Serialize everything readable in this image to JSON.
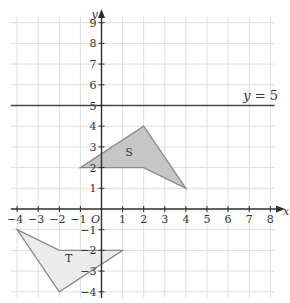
{
  "diagram": {
    "type": "coordinate-grid",
    "axes": {
      "x_label": "y",
      "x_axis_name": "x",
      "y_axis_name": "y",
      "origin_label": "O",
      "x_ticks": [
        -4,
        -3,
        -2,
        -1,
        1,
        2,
        3,
        4,
        5,
        6,
        7,
        8
      ],
      "y_ticks": [
        9,
        8,
        7,
        6,
        5,
        4,
        3,
        2,
        1,
        -1,
        -2,
        -3,
        -4
      ],
      "x_range": [
        -4.3,
        8.2
      ],
      "y_range": [
        -4.3,
        9.3
      ]
    },
    "line": {
      "label": "y = 5",
      "label_var": "y",
      "label_rest": " = 5",
      "y": 5
    },
    "shapes": [
      {
        "name": "S",
        "vertices": [
          [
            -1,
            2
          ],
          [
            2,
            4
          ],
          [
            4,
            1
          ],
          [
            2,
            2
          ]
        ],
        "fill": "#c6c6c6",
        "stroke": "#8a8a8a",
        "label_pos": [
          1.3,
          2.55
        ]
      },
      {
        "name": "T",
        "vertices": [
          [
            -4,
            -1
          ],
          [
            -2,
            -2
          ],
          [
            1,
            -2
          ],
          [
            -2,
            -4
          ]
        ],
        "fill": "#ececec",
        "stroke": "#8a8a8a",
        "label_pos": [
          -1.55,
          -2.55
        ]
      }
    ],
    "colors": {
      "axis": "#2e2e2e",
      "grid": "#dedede",
      "line": "#4a4a4a"
    }
  }
}
